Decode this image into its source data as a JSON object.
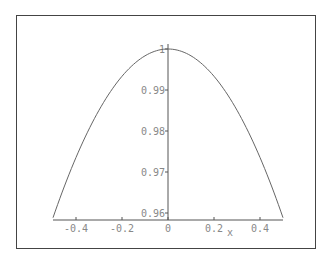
{
  "chart_data": {
    "type": "line",
    "title": "",
    "xlabel": "x",
    "ylabel": "",
    "xlim": [
      -0.5,
      0.5
    ],
    "ylim": [
      0.958,
      1.0
    ],
    "grid": false,
    "legend": null,
    "x_ticks": [
      {
        "value": -0.4,
        "label": "-0.4"
      },
      {
        "value": -0.2,
        "label": "-0.2"
      },
      {
        "value": 0,
        "label": "0"
      },
      {
        "value": 0.2,
        "label": "0.2"
      },
      {
        "value": 0.4,
        "label": "0.4"
      }
    ],
    "y_ticks": [
      {
        "value": 1.0,
        "label": "1"
      },
      {
        "value": 0.99,
        "label": "0.99"
      },
      {
        "value": 0.98,
        "label": "0.98"
      },
      {
        "value": 0.97,
        "label": "0.97"
      },
      {
        "value": 0.96,
        "label": "0.96"
      }
    ],
    "series": [
      {
        "name": "sin(x)/x",
        "x": [
          -0.5,
          -0.4,
          -0.3,
          -0.2,
          -0.1,
          0,
          0.1,
          0.2,
          0.3,
          0.4,
          0.5
        ],
        "y": [
          0.9589,
          0.9735,
          0.9851,
          0.9933,
          0.9983,
          1.0,
          0.9983,
          0.9933,
          0.9851,
          0.9735,
          0.9589
        ]
      }
    ],
    "colors": {
      "curve": "#666666",
      "axis": "#555555",
      "labels": "#888888",
      "frame": "#444444"
    }
  }
}
